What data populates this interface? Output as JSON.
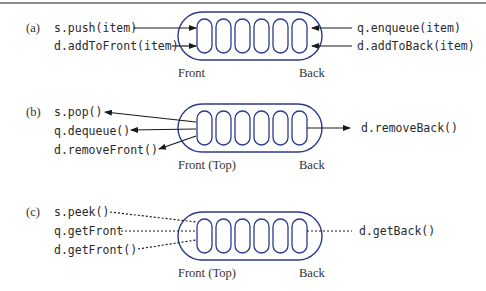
{
  "figure": {
    "panels": [
      {
        "id": "a",
        "label": "(a)",
        "left_ops": [
          "s.push(item)",
          "d.addToFront(item)"
        ],
        "right_ops": [
          "q.enqueue(item)",
          "d.addToBack(item)"
        ],
        "front_label": "Front",
        "back_label": "Back",
        "arrow_style": "solid-into",
        "slots": 6
      },
      {
        "id": "b",
        "label": "(b)",
        "left_ops": [
          "s.pop()",
          "q.dequeue()",
          "d.removeFront()"
        ],
        "right_ops": [
          "d.removeBack()"
        ],
        "front_label": "Front (Top)",
        "back_label": "Back",
        "arrow_style": "solid-out",
        "slots": 6
      },
      {
        "id": "c",
        "label": "(c)",
        "left_ops": [
          "s.peek()",
          "q.getFront",
          "d.getFront()"
        ],
        "right_ops": [
          "d.getBack()"
        ],
        "front_label": "Front (Top)",
        "back_label": "Back",
        "arrow_style": "dotted",
        "slots": 6
      }
    ],
    "colors": {
      "capsule": "#2b3990",
      "arrow": "#1a1a1a",
      "text": "#2a2a2a",
      "rule": "#8c8c8c"
    }
  }
}
